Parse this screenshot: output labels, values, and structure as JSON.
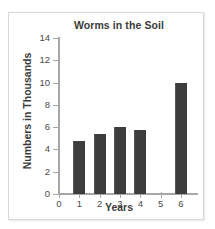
{
  "chart_data": {
    "type": "bar",
    "title": "Worms in the Soil",
    "xlabel": "Years",
    "ylabel": "Numbers in Thousands",
    "categories": [
      "1",
      "2",
      "3",
      "4",
      "5",
      "6"
    ],
    "values": [
      4.75,
      5.4,
      6.0,
      5.75,
      0,
      10
    ],
    "x_ticks": [
      "0",
      "1",
      "2",
      "3",
      "4",
      "5",
      "6"
    ],
    "y_ticks": [
      "0",
      "2",
      "4",
      "6",
      "8",
      "10",
      "12",
      "14"
    ],
    "xlim": [
      0,
      6
    ],
    "ylim": [
      0,
      14
    ],
    "grid": false,
    "legend": false,
    "bar_color": "#3d3d3d",
    "axis_color": "#a7a7a7",
    "text_color": "#3b3b3b"
  }
}
